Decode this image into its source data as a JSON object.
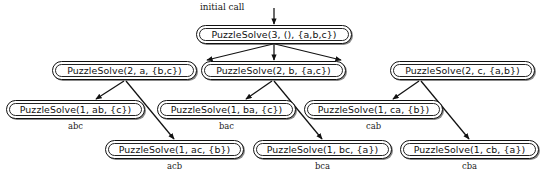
{
  "diagram": {
    "entry_label": "initial call",
    "background_color": "#ffffff",
    "line_color": "#111111",
    "text_color": "#101010"
  },
  "nodes": {
    "root": {
      "label": "PuzzleSolve(3, (), {a,b,c})"
    },
    "level2": [
      {
        "label": "PuzzleSolve(2, a, {b,c})"
      },
      {
        "label": "PuzzleSolve(2, b, {a,c})"
      },
      {
        "label": "PuzzleSolve(2, c, {a,b})"
      }
    ],
    "level3_upper": [
      {
        "label": "PuzzleSolve(1, ab, {c})",
        "caption": "abc"
      },
      {
        "label": "PuzzleSolve(1, ba, {c})",
        "caption": "bac"
      },
      {
        "label": "PuzzleSolve(1, ca, {b})",
        "caption": "cab"
      }
    ],
    "level3_lower": [
      {
        "label": "PuzzleSolve(1, ac, {b})",
        "caption": "acb"
      },
      {
        "label": "PuzzleSolve(1, bc, {a})",
        "caption": "bca"
      },
      {
        "label": "PuzzleSolve(1, cb, {a})",
        "caption": "cba"
      }
    ]
  }
}
